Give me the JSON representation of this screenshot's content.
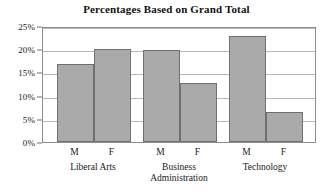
{
  "chart_data": {
    "type": "bar",
    "title": "Percentages Based on Grand Total",
    "xlabel": "",
    "ylabel": "",
    "ylim": [
      0,
      25
    ],
    "grid": true,
    "legend": "none",
    "y_ticks": [
      {
        "value": 0,
        "label": "0%"
      },
      {
        "value": 5,
        "label": "5%"
      },
      {
        "value": 10,
        "label": "10%"
      },
      {
        "value": 15,
        "label": "15%"
      },
      {
        "value": 20,
        "label": "20%"
      },
      {
        "value": 25,
        "label": "25%"
      }
    ],
    "groups": [
      {
        "name": "Liberal Arts",
        "lines": [
          "Liberal Arts"
        ]
      },
      {
        "name": "Business Administration",
        "lines": [
          "Business",
          "Administration"
        ]
      },
      {
        "name": "Technology",
        "lines": [
          "Technology"
        ]
      }
    ],
    "categories": [
      "M",
      "F",
      "M",
      "F",
      "M",
      "F"
    ],
    "values": [
      16.8,
      20.0,
      19.8,
      12.8,
      22.8,
      6.5
    ],
    "bars": [
      {
        "group": "Liberal Arts",
        "sex": "M",
        "value": 16.8
      },
      {
        "group": "Liberal Arts",
        "sex": "F",
        "value": 20.0
      },
      {
        "group": "Business Administration",
        "sex": "M",
        "value": 19.8
      },
      {
        "group": "Business Administration",
        "sex": "F",
        "value": 12.8
      },
      {
        "group": "Technology",
        "sex": "M",
        "value": 22.8
      },
      {
        "group": "Technology",
        "sex": "F",
        "value": 6.5
      }
    ],
    "colors": {
      "bar_fill": "#aaaaaa",
      "bar_border": "#70706f",
      "gridline": "#b9b9b9",
      "plot_border": "#8d8d8d",
      "text": "#1a1a1a"
    }
  }
}
